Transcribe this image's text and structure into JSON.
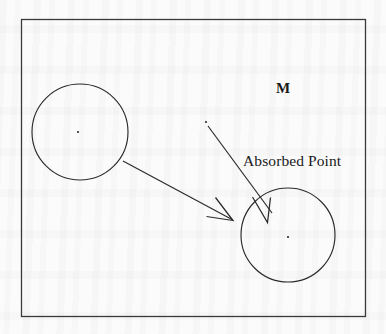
{
  "figure": {
    "kind": "geometric-diagram",
    "caption_free": true,
    "background_color": "#fbfbfb",
    "ink_color": "#2b2b2b",
    "frame": {
      "name": "outer-rectangle",
      "x": 21,
      "y": 19,
      "width": 344,
      "height": 297,
      "stroke_width": 1.3
    },
    "labels": {
      "space_label": "M",
      "annotation_label": "Absorbed Point"
    },
    "circles": [
      {
        "name": "source-circle",
        "cx": 80,
        "cy": 132,
        "r": 48,
        "center_dot": true
      },
      {
        "name": "target-circle",
        "cx": 288,
        "cy": 235,
        "r": 47,
        "center_dot": true
      }
    ],
    "points": [
      {
        "name": "source-circle-center-point",
        "x": 78,
        "y": 132
      },
      {
        "name": "target-circle-center-point",
        "x": 288,
        "y": 237
      },
      {
        "name": "absorbed-point",
        "x": 206,
        "y": 122
      }
    ],
    "arrows": [
      {
        "name": "mapping-arrow",
        "from_x": 123,
        "from_y": 161,
        "to_x": 233,
        "to_y": 220,
        "description": "long straight arrow from source circle to target circle"
      },
      {
        "name": "absorbed-point-arrow",
        "from_x": 208,
        "from_y": 126,
        "to_x": 269,
        "to_y": 215,
        "description": "straight arrow from the absorbed point down into the target circle"
      }
    ]
  }
}
